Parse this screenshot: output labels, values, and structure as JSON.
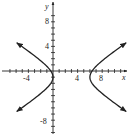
{
  "chart_data": {
    "type": "line",
    "title": "",
    "xlabel": "x",
    "ylabel": "y",
    "xlim": [
      -8,
      12
    ],
    "ylim": [
      -10,
      10
    ],
    "x_tick_labels": [
      "-4",
      "4",
      "8"
    ],
    "y_tick_labels": [
      "8",
      "4",
      "-8"
    ],
    "x_ticks": [
      -7,
      -6,
      -5,
      -4,
      -3,
      -2,
      -1,
      1,
      2,
      3,
      4,
      5,
      6,
      7,
      8,
      9,
      10,
      11
    ],
    "y_ticks": [
      -10,
      -9,
      -8,
      -7,
      -6,
      -5,
      -4,
      -3,
      -2,
      -1,
      1,
      2,
      3,
      4,
      5,
      6,
      7,
      8,
      9
    ],
    "grid": false,
    "series": [
      {
        "name": "hyperbola",
        "equation": "(x-3)^2/9 - (y+1)^2/4 = 1",
        "center": [
          3,
          -1
        ],
        "vertices": [
          [
            0,
            -1
          ],
          [
            6,
            -1
          ]
        ],
        "branches": [
          "left",
          "right"
        ],
        "arrows": true
      }
    ],
    "color": "#222222"
  },
  "labels": {
    "x_axis": "x",
    "y_axis": "y",
    "xt_neg4": "-4",
    "xt_4": "4",
    "xt_8": "8",
    "yt_8": "8",
    "yt_4": "4",
    "yt_neg8": "-8"
  }
}
